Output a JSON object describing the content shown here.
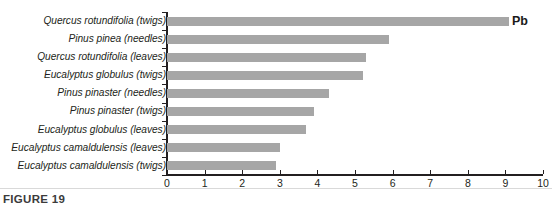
{
  "figure": {
    "caption": "FIGURE 19",
    "series_label": "Pb",
    "bar_color": "#a6a6a6",
    "axis_color": "#231f20"
  },
  "chart_data": {
    "type": "bar",
    "orientation": "horizontal",
    "title": "",
    "subtitle": "",
    "xlabel": "",
    "ylabel": "",
    "xlim": [
      0,
      10
    ],
    "xticks": [
      0,
      1,
      2,
      3,
      4,
      5,
      6,
      7,
      8,
      9,
      10
    ],
    "xticklabels": [
      "0",
      "1",
      "2",
      "3",
      "4",
      "5",
      "6",
      "7",
      "8",
      "9",
      "10"
    ],
    "grid": false,
    "legend": null,
    "annotations": [
      "Pb"
    ],
    "categories": [
      "Quercus rotundifolia (twigs)",
      "Pinus pinea (needles)",
      "Quercus rotundifolia (leaves)",
      "Eucalyptus globulus (twigs)",
      "Pinus pinaster (needles)",
      "Pinus pinaster (twigs)",
      "Eucalyptus globulus (leaves)",
      "Eucalyptus camaldulensis (leaves)",
      "Eucalyptus camaldulensis (twigs)"
    ],
    "series": [
      {
        "name": "Pb",
        "values": [
          9.1,
          5.9,
          5.3,
          5.2,
          4.3,
          3.9,
          3.7,
          3.0,
          2.9
        ]
      }
    ],
    "points": [
      {
        "category": "Quercus rotundifolia (twigs)",
        "species": "Quercus rotundifolia",
        "part": "(twigs)",
        "value": 9.1
      },
      {
        "category": "Pinus pinea (needles)",
        "species": "Pinus pinea",
        "part": "(needles)",
        "value": 5.9
      },
      {
        "category": "Quercus rotundifolia (leaves)",
        "species": "Quercus rotundifolia",
        "part": "(leaves)",
        "value": 5.3
      },
      {
        "category": "Eucalyptus globulus (twigs)",
        "species": "Eucalyptus globulus",
        "part": "(twigs)",
        "value": 5.2
      },
      {
        "category": "Pinus pinaster (needles)",
        "species": "Pinus pinaster",
        "part": "(needles)",
        "value": 4.3
      },
      {
        "category": "Pinus pinaster (twigs)",
        "species": "Pinus pinaster",
        "part": "(twigs)",
        "value": 3.9
      },
      {
        "category": "Eucalyptus globulus (leaves)",
        "species": "Eucalyptus globulus",
        "part": "(leaves)",
        "value": 3.7
      },
      {
        "category": "Eucalyptus camaldulensis (leaves)",
        "species": "Eucalyptus camaldulensis",
        "part": "(leaves)",
        "value": 3.0
      },
      {
        "category": "Eucalyptus camaldulensis (twigs)",
        "species": "Eucalyptus camaldulensis",
        "part": "(twigs)",
        "value": 2.9
      }
    ]
  }
}
